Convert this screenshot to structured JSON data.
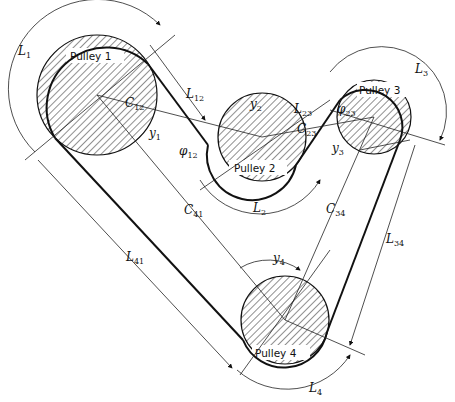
{
  "diagram": {
    "type": "belt-pulley drive geometry",
    "pulleys": [
      {
        "id": 1,
        "label": "Pulley 1",
        "cx": 97,
        "cy": 95,
        "r": 60
      },
      {
        "id": 2,
        "label": "Pulley 2",
        "cx": 262,
        "cy": 137,
        "r": 44
      },
      {
        "id": 3,
        "label": "Pulley 3",
        "cx": 374,
        "cy": 117,
        "r": 37
      },
      {
        "id": 4,
        "label": "Pulley 4",
        "cx": 285,
        "cy": 320,
        "r": 44
      }
    ],
    "labels": {
      "L1": {
        "main": "L",
        "sub": "1"
      },
      "L12": {
        "main": "L",
        "sub": "12"
      },
      "C12": {
        "main": "C",
        "sub": "12"
      },
      "y1": {
        "main": "y",
        "sub": "1"
      },
      "phi12": {
        "main": "φ",
        "sub": "12"
      },
      "y2": {
        "main": "y",
        "sub": "2"
      },
      "L23": {
        "main": "L",
        "sub": "23"
      },
      "C23": {
        "main": "C",
        "sub": "23"
      },
      "phi23": {
        "main": "φ",
        "sub": "23"
      },
      "L3": {
        "main": "L",
        "sub": "3"
      },
      "y3": {
        "main": "y",
        "sub": "3"
      },
      "L2": {
        "main": "L",
        "sub": "2"
      },
      "C41": {
        "main": "C",
        "sub": "41"
      },
      "C34": {
        "main": "C",
        "sub": "34"
      },
      "L34": {
        "main": "L",
        "sub": "34"
      },
      "y4": {
        "main": "y",
        "sub": "4"
      },
      "L41": {
        "main": "L",
        "sub": "41"
      },
      "L4": {
        "main": "L",
        "sub": "4"
      }
    }
  }
}
